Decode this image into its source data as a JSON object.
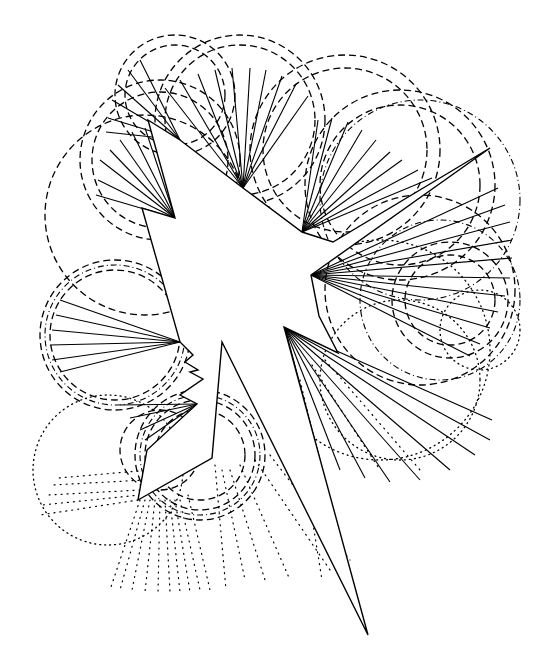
{
  "artwork": {
    "description": "Black-and-white abstract line drawing: a white star-burst polygon with fans of straight lines radiating from its concave vertices, surrounded by concentric dashed, dash-dotted and dotted arcs",
    "colors": {
      "background": "#ffffff",
      "ink": "#000000"
    },
    "star_polygon": [
      [
        148,
        120
      ],
      [
        180,
        140
      ],
      [
        243,
        188
      ],
      [
        302,
        232
      ],
      [
        333,
        242
      ],
      [
        490,
        148
      ],
      [
        311,
        275
      ],
      [
        319,
        316
      ],
      [
        338,
        353
      ],
      [
        284,
        327
      ],
      [
        368,
        635
      ],
      [
        222,
        342
      ],
      [
        212,
        458
      ],
      [
        138,
        500
      ],
      [
        147,
        450
      ],
      [
        197,
        404
      ],
      [
        180,
        395
      ],
      [
        203,
        379
      ],
      [
        190,
        372
      ],
      [
        198,
        370
      ],
      [
        185,
        362
      ],
      [
        193,
        355
      ],
      [
        180,
        342
      ],
      [
        142,
        208
      ],
      [
        175,
        218
      ]
    ],
    "fans": [
      {
        "apex": [
          180,
          140
        ],
        "ends": [
          [
            140,
            60
          ],
          [
            128,
            70
          ],
          [
            118,
            85
          ],
          [
            112,
            100
          ],
          [
            108,
            118
          ],
          [
            106,
            132
          ]
        ]
      },
      {
        "apex": [
          175,
          218
        ],
        "ends": [
          [
            100,
            160
          ],
          [
            110,
            150
          ],
          [
            120,
            140
          ],
          [
            132,
            132
          ],
          [
            145,
            128
          ],
          [
            98,
            180
          ],
          [
            96,
            195
          ]
        ]
      },
      {
        "apex": [
          243,
          188
        ],
        "ends": [
          [
            165,
            88
          ],
          [
            180,
            80
          ],
          [
            198,
            74
          ],
          [
            215,
            70
          ],
          [
            232,
            68
          ],
          [
            250,
            68
          ],
          [
            266,
            70
          ],
          [
            282,
            76
          ],
          [
            296,
            84
          ],
          [
            308,
            96
          ]
        ]
      },
      {
        "apex": [
          302,
          232
        ],
        "ends": [
          [
            318,
            120
          ],
          [
            332,
            118
          ],
          [
            348,
            122
          ],
          [
            362,
            130
          ],
          [
            376,
            140
          ],
          [
            390,
            152
          ],
          [
            402,
            160
          ],
          [
            418,
            170
          ],
          [
            432,
            178
          ]
        ]
      },
      {
        "apex": [
          311,
          275
        ],
        "ends": [
          [
            498,
            188
          ],
          [
            505,
            205
          ],
          [
            510,
            222
          ],
          [
            512,
            240
          ],
          [
            512,
            258
          ],
          [
            510,
            278
          ],
          [
            505,
            296
          ],
          [
            498,
            312
          ],
          [
            490,
            328
          ],
          [
            480,
            344
          ],
          [
            470,
            356
          ]
        ]
      },
      {
        "apex": [
          180,
          342
        ],
        "ends": [
          [
            60,
            300
          ],
          [
            56,
            315
          ],
          [
            52,
            330
          ],
          [
            50,
            345
          ],
          [
            52,
            360
          ],
          [
            60,
            372
          ]
        ]
      },
      {
        "apex": [
          197,
          404
        ],
        "ends": [
          [
            120,
            405
          ],
          [
            130,
            418
          ],
          [
            140,
            430
          ],
          [
            145,
            440
          ]
        ]
      },
      {
        "apex": [
          285,
          328
        ],
        "ends": [
          [
            320,
            460
          ],
          [
            340,
            470
          ],
          [
            365,
            478
          ],
          [
            390,
            482
          ],
          [
            420,
            480
          ],
          [
            450,
            470
          ],
          [
            475,
            455
          ],
          [
            490,
            440
          ],
          [
            492,
            420
          ]
        ]
      }
    ],
    "arcs": [
      {
        "type": "dash",
        "cx": 240,
        "cy": 120,
        "r": 85
      },
      {
        "type": "dash",
        "cx": 240,
        "cy": 120,
        "r": 75
      },
      {
        "type": "dash",
        "cx": 175,
        "cy": 95,
        "r": 60
      },
      {
        "type": "dash",
        "cx": 175,
        "cy": 95,
        "r": 50
      },
      {
        "type": "dash",
        "cx": 160,
        "cy": 160,
        "r": 80
      },
      {
        "type": "dash",
        "cx": 160,
        "cy": 160,
        "r": 68
      },
      {
        "type": "dash",
        "cx": 145,
        "cy": 215,
        "r": 100
      },
      {
        "type": "dash",
        "cx": 345,
        "cy": 150,
        "r": 95
      },
      {
        "type": "dash",
        "cx": 345,
        "cy": 150,
        "r": 82
      },
      {
        "type": "dash",
        "cx": 400,
        "cy": 185,
        "r": 95
      },
      {
        "type": "dash",
        "cx": 400,
        "cy": 185,
        "r": 80
      },
      {
        "type": "dashdot",
        "cx": 420,
        "cy": 200,
        "r": 100
      },
      {
        "type": "dash",
        "cx": 420,
        "cy": 290,
        "r": 95
      },
      {
        "type": "dash",
        "cx": 450,
        "cy": 300,
        "r": 45
      },
      {
        "type": "dash",
        "cx": 450,
        "cy": 300,
        "r": 58
      },
      {
        "type": "dashdot",
        "cx": 440,
        "cy": 300,
        "r": 80
      },
      {
        "type": "dash",
        "cx": 115,
        "cy": 335,
        "r": 75
      },
      {
        "type": "dash",
        "cx": 115,
        "cy": 335,
        "r": 65
      },
      {
        "type": "dashdot",
        "cx": 115,
        "cy": 335,
        "r": 70
      },
      {
        "type": "dash",
        "cx": 200,
        "cy": 455,
        "r": 65
      },
      {
        "type": "dash",
        "cx": 200,
        "cy": 455,
        "r": 55
      },
      {
        "type": "dash",
        "cx": 200,
        "cy": 455,
        "r": 45
      },
      {
        "type": "dashdot",
        "cx": 200,
        "cy": 455,
        "r": 60
      },
      {
        "type": "dash",
        "cx": 160,
        "cy": 450,
        "r": 40
      },
      {
        "type": "dot",
        "cx": 108,
        "cy": 470,
        "r": 75
      },
      {
        "type": "dot",
        "cx": 380,
        "cy": 350,
        "r": 110
      },
      {
        "type": "dot",
        "cx": 400,
        "cy": 380,
        "r": 80
      },
      {
        "type": "dot",
        "cx": 480,
        "cy": 330,
        "r": 40
      }
    ],
    "dotted_rays": [
      [
        [
          140,
          500
        ],
        [
          110,
          590
        ]
      ],
      [
        [
          145,
          500
        ],
        [
          120,
          590
        ]
      ],
      [
        [
          150,
          500
        ],
        [
          132,
          590
        ]
      ],
      [
        [
          155,
          500
        ],
        [
          145,
          592
        ]
      ],
      [
        [
          160,
          500
        ],
        [
          158,
          592
        ]
      ],
      [
        [
          165,
          500
        ],
        [
          170,
          592
        ]
      ],
      [
        [
          170,
          500
        ],
        [
          180,
          592
        ]
      ],
      [
        [
          175,
          500
        ],
        [
          190,
          592
        ]
      ],
      [
        [
          180,
          500
        ],
        [
          200,
          590
        ]
      ],
      [
        [
          188,
          495
        ],
        [
          210,
          590
        ]
      ],
      [
        [
          215,
          465
        ],
        [
          226,
          590
        ]
      ],
      [
        [
          222,
          470
        ],
        [
          245,
          580
        ]
      ],
      [
        [
          230,
          470
        ],
        [
          265,
          580
        ]
      ],
      [
        [
          240,
          465
        ],
        [
          290,
          580
        ]
      ],
      [
        [
          255,
          460
        ],
        [
          330,
          570
        ]
      ],
      [
        [
          270,
          455
        ],
        [
          350,
          560
        ]
      ],
      [
        [
          290,
          380
        ],
        [
          322,
          580
        ]
      ],
      [
        [
          300,
          380
        ],
        [
          345,
          570
        ]
      ],
      [
        [
          312,
          365
        ],
        [
          380,
          470
        ]
      ],
      [
        [
          325,
          360
        ],
        [
          420,
          470
        ]
      ],
      [
        [
          138,
          500
        ],
        [
          40,
          515
        ]
      ],
      [
        [
          140,
          495
        ],
        [
          42,
          505
        ]
      ],
      [
        [
          140,
          490
        ],
        [
          48,
          495
        ]
      ],
      [
        [
          145,
          480
        ],
        [
          52,
          485
        ]
      ],
      [
        [
          150,
          470
        ],
        [
          58,
          478
        ]
      ]
    ]
  }
}
